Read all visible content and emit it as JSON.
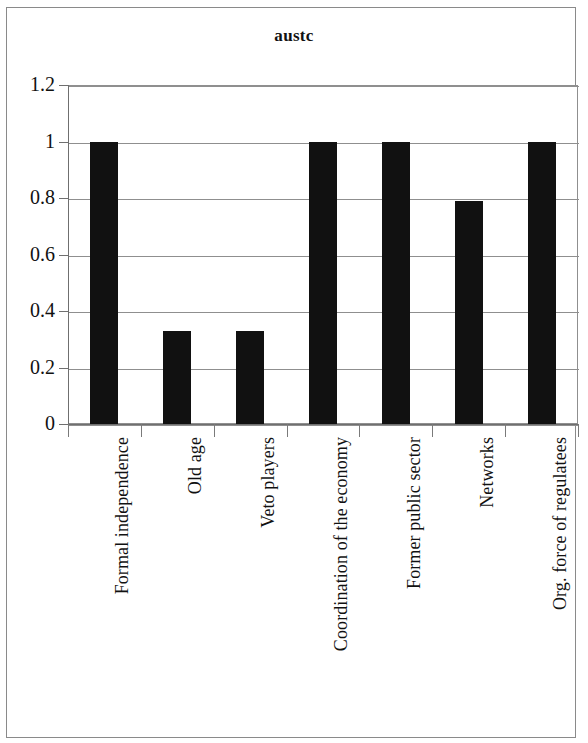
{
  "chart_data": {
    "type": "bar",
    "title": "austc",
    "xlabel": "",
    "ylabel": "",
    "ylim": [
      0,
      1.2
    ],
    "yticks": [
      "0",
      "0.2",
      "0.4",
      "0.6",
      "0.8",
      "1",
      "1.2"
    ],
    "ytick_values": [
      0,
      0.2,
      0.4,
      0.6,
      0.8,
      1,
      1.2
    ],
    "grid": true,
    "legend": "none",
    "bar_color": "#111111",
    "categories": [
      "Formal independence",
      "Old age",
      "Veto players",
      "Coordination of the economy",
      "Former public sector",
      "Networks",
      "Org. force of regulatees"
    ],
    "values": [
      1,
      0.33,
      0.33,
      1,
      1,
      0.79,
      1
    ]
  },
  "figure": {
    "title": "austc"
  }
}
